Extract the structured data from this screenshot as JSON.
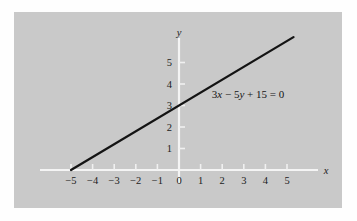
{
  "figure": {
    "background_color": "#fefefe",
    "panel_color": "#c9c9c9",
    "axis_color": "#f4f4f4",
    "line_color": "#141414"
  },
  "chart_data": {
    "type": "line",
    "title": "",
    "subtitle": "",
    "xlabel": "x",
    "ylabel": "y",
    "xlim": [
      -6.4,
      6.4
    ],
    "ylim": [
      -0.6,
      6.6
    ],
    "grid": false,
    "legend": "none",
    "annotations": [
      {
        "text": "3x − 5y + 15 = 0",
        "parts": [
          {
            "t": "3",
            "italic": false
          },
          {
            "t": "x",
            "italic": true
          },
          {
            "t": " − 5",
            "italic": false
          },
          {
            "t": "y",
            "italic": true
          },
          {
            "t": " + 15 = 0",
            "italic": false
          }
        ],
        "x": 1.52,
        "y": 3.35
      }
    ],
    "x_ticks": [
      -5,
      -4,
      -3,
      -2,
      -1,
      0,
      1,
      2,
      3,
      4,
      5
    ],
    "x_tick_labels": [
      "−5",
      "−4",
      "−3",
      "−2",
      "−1",
      "0",
      "1",
      "2",
      "3",
      "4",
      "5"
    ],
    "y_ticks": [
      1,
      2,
      3,
      4,
      5
    ],
    "y_tick_labels": [
      "1",
      "2",
      "3",
      "4",
      "5"
    ],
    "series": [
      {
        "name": "3x − 5y + 15 = 0",
        "equation": "y = 0.6x + 3",
        "slope": 0.6,
        "intercept": 3,
        "x_intercept": -5,
        "y_intercept": 3,
        "points": [
          {
            "x": -5,
            "y": 0
          },
          {
            "x": 5.3,
            "y": 6.18
          }
        ]
      }
    ]
  }
}
